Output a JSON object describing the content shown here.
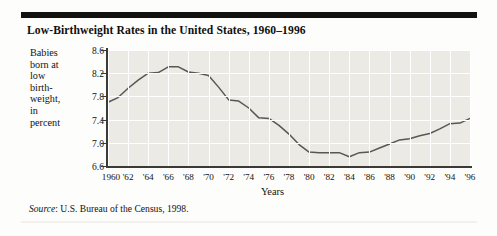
{
  "figure": {
    "title": "Low-Birthweight Rates in the United States, 1960–1996",
    "source_label": "Source",
    "source_text": ": U.S. Bureau of the Census, 1998."
  },
  "ylabel_lines": [
    "Babies",
    "born at",
    "low",
    "birth-",
    "weight,",
    "in",
    "percent"
  ],
  "chart_data": {
    "type": "line",
    "title": "Low-Birthweight Rates in the United States, 1960–1996",
    "xlabel": "Years",
    "ylabel": "Babies born at low birthweight, in percent",
    "xlim": [
      1960,
      1996
    ],
    "ylim": [
      6.6,
      8.6
    ],
    "yticks": [
      8.6,
      8.2,
      7.8,
      7.4,
      7.0,
      6.6
    ],
    "ytick_labels": [
      "8.6",
      "8.2",
      "7.8",
      "7.4",
      "7.0",
      "6.6"
    ],
    "xticks": [
      1960,
      1962,
      1964,
      1966,
      1968,
      1970,
      1972,
      1974,
      1976,
      1978,
      1980,
      1982,
      1984,
      1986,
      1988,
      1990,
      1992,
      1994,
      1996
    ],
    "xtick_labels": [
      "1960",
      "'62",
      "'64",
      "'66",
      "'68",
      "'70",
      "'72",
      "'74",
      "'76",
      "'78",
      "'80",
      "'82",
      "'84",
      "'86",
      "'88",
      "'90",
      "'92",
      "'94",
      "'96"
    ],
    "grid": true,
    "legend": null,
    "series": [
      {
        "name": "Low-birthweight rate",
        "color": "#595751",
        "x": [
          1960,
          1961,
          1962,
          1963,
          1964,
          1965,
          1966,
          1967,
          1968,
          1969,
          1970,
          1971,
          1972,
          1973,
          1974,
          1975,
          1976,
          1977,
          1978,
          1979,
          1980,
          1981,
          1982,
          1983,
          1984,
          1985,
          1986,
          1987,
          1988,
          1989,
          1990,
          1991,
          1992,
          1993,
          1994,
          1995,
          1996
        ],
        "values": [
          7.7,
          7.78,
          7.94,
          8.08,
          8.2,
          8.21,
          8.31,
          8.31,
          8.22,
          8.2,
          8.16,
          7.96,
          7.74,
          7.72,
          7.6,
          7.43,
          7.42,
          7.3,
          7.15,
          6.97,
          6.84,
          6.83,
          6.83,
          6.83,
          6.76,
          6.83,
          6.84,
          6.91,
          6.98,
          7.05,
          7.07,
          7.12,
          7.16,
          7.24,
          7.33,
          7.34,
          7.42
        ]
      }
    ]
  }
}
